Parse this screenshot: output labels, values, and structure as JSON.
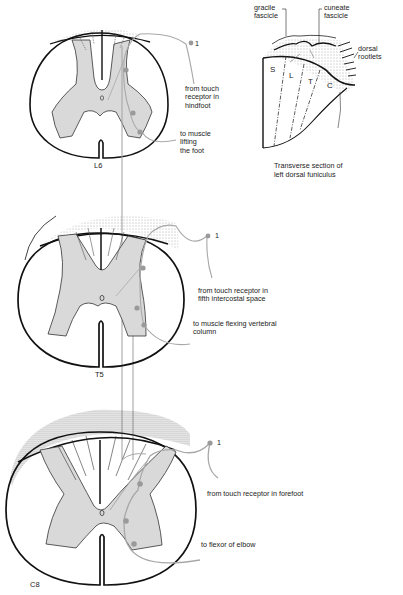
{
  "diagram": {
    "sections": [
      {
        "segment": "L6",
        "neuron_number": "1",
        "afferent_label": "from touch\nreceptor in\nhindfoot",
        "efferent_label": "to muscle\nlifting\nthe foot"
      },
      {
        "segment": "T5",
        "neuron_number": "1",
        "afferent_label": "from touch receptor in\nfifth intercostal space",
        "efferent_label": "to muscle flexing vertebral\ncolumn"
      },
      {
        "segment": "C8",
        "neuron_number": "1",
        "afferent_label": "from touch receptor in forefoot",
        "efferent_label": "to flexor of elbow"
      }
    ],
    "inset": {
      "gracile_label": "gracile\nfascicle",
      "cuneate_label": "cuneate\nfascicle",
      "rootlets_label": "dorsal\nrootlets",
      "regions": [
        "S",
        "L",
        "T",
        "C"
      ],
      "caption": "Transverse section of\nleft dorsal funiculus"
    },
    "colors": {
      "outline": "#111111",
      "gray_matter": "#d9d9d9",
      "pathway": "#a8a8a8",
      "neuron": "#9a9a9a"
    }
  }
}
